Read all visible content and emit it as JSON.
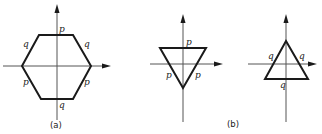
{
  "figure": {
    "panel_a": {
      "caption": "(a)",
      "shape": "hexagon",
      "edge_labels": {
        "top": "p",
        "upper_left": "q",
        "upper_right": "q",
        "lower_left": "p",
        "lower_right": "p",
        "bottom": "q"
      }
    },
    "panel_b": {
      "caption": "(b)",
      "left": {
        "shape": "inverted-triangle",
        "edge_labels": {
          "top": "p",
          "left": "p",
          "right": "p"
        }
      },
      "right": {
        "shape": "upright-triangle",
        "edge_labels": {
          "left": "q",
          "right": "q",
          "bottom": "q"
        }
      }
    }
  }
}
